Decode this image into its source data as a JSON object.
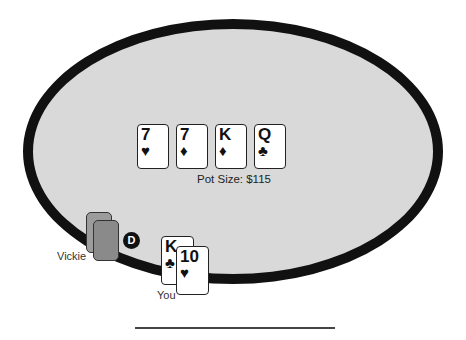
{
  "table": {
    "pot_label": "Pot Size: $115",
    "community_cards": [
      {
        "rank": "7",
        "suit": "♥",
        "suit_name": "hearts"
      },
      {
        "rank": "7",
        "suit": "♦",
        "suit_name": "diamonds"
      },
      {
        "rank": "K",
        "suit": "♦",
        "suit_name": "diamonds"
      },
      {
        "rank": "Q",
        "suit": "♣",
        "suit_name": "clubs"
      }
    ],
    "dealer_button": "D"
  },
  "players": {
    "opponent": {
      "name": "Vickie",
      "cards": "face-down",
      "card_count": 2
    },
    "hero": {
      "name": "You",
      "cards": [
        {
          "rank": "K",
          "suit": "♣",
          "suit_name": "clubs"
        },
        {
          "rank": "10",
          "suit": "♥",
          "suit_name": "hearts"
        }
      ]
    }
  },
  "colors": {
    "felt": "#d9d9d9",
    "rail": "#111111",
    "card_back": "#8a8a8a"
  }
}
